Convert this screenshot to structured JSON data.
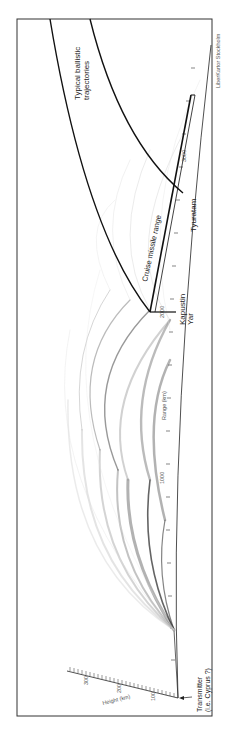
{
  "figure": {
    "frame_color": "#333333",
    "line_color": "#111111",
    "ray_color": "#555555",
    "credit": "LiberKartor Stockholm"
  },
  "labels": {
    "ballistic_line1": "Typical ballistic",
    "ballistic_line2": "trajectories",
    "cruise": "Cruise missile range",
    "tyuratam": "Tyuratam",
    "kapustin_line1": "Kapustin",
    "kapustin_line2": "Yar",
    "transmitter_line1": "Transmitter",
    "transmitter_line2": "(i.e. Cyprus ?)"
  },
  "range_axis": {
    "title": "Range (km)",
    "ticks": [
      "1000",
      "2000",
      "3000"
    ]
  },
  "height_axis": {
    "title": "Height (km)",
    "ticks": [
      "100",
      "200",
      "300"
    ]
  }
}
